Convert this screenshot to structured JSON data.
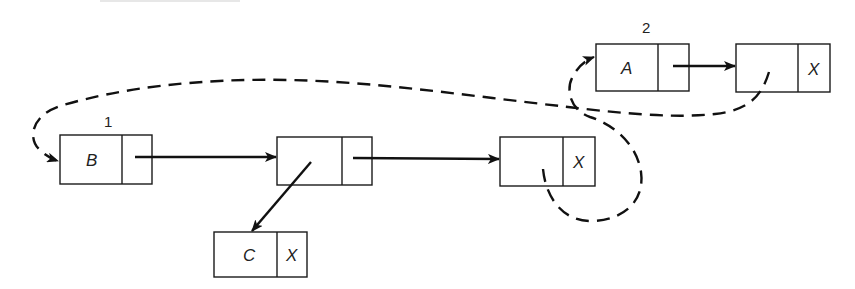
{
  "diagram": {
    "colors": {
      "stroke": "#111111",
      "background": "#ffffff",
      "text": "#222222"
    },
    "list_labels": [
      {
        "id": "label-1",
        "text": "1"
      },
      {
        "id": "label-2",
        "text": "2"
      }
    ],
    "nodes": [
      {
        "id": "node-b",
        "data": "B",
        "link": ""
      },
      {
        "id": "node-mid",
        "data": "",
        "link": ""
      },
      {
        "id": "node-tail1",
        "data": "",
        "link": "X"
      },
      {
        "id": "node-c",
        "data": "C",
        "link": "X"
      },
      {
        "id": "node-a",
        "data": "A",
        "link": ""
      },
      {
        "id": "node-tail2",
        "data": "",
        "link": "X"
      }
    ],
    "edges": [
      {
        "from": "node-b",
        "to": "node-mid",
        "style": "solid"
      },
      {
        "from": "node-mid",
        "to": "node-tail1",
        "style": "solid"
      },
      {
        "from": "node-mid",
        "to": "node-c",
        "style": "solid"
      },
      {
        "from": "node-a",
        "to": "node-tail2",
        "style": "solid"
      },
      {
        "from": "node-tail2",
        "to": "node-b",
        "style": "dashed"
      },
      {
        "from": "node-tail1",
        "to": "node-a",
        "style": "dashed"
      }
    ]
  }
}
